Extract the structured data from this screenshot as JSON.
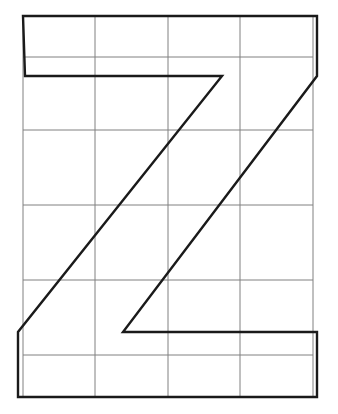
{
  "figure": {
    "glyph": "Z",
    "background_color": "#ffffff",
    "canvas": {
      "width": 338,
      "height": 414
    }
  },
  "grid": {
    "name": "construction-grid",
    "stroke_color": "#808080",
    "stroke_width": 1,
    "columns": 4,
    "rows": 6,
    "x_lines": [
      23,
      95,
      168,
      240,
      313
    ],
    "y_lines": [
      16,
      57,
      130,
      205,
      280,
      355,
      397
    ],
    "bounds": {
      "left": 23,
      "top": 16,
      "right": 313,
      "bottom": 397
    }
  },
  "glyph_outline": {
    "name": "letter-z-outline",
    "stroke_color": "#1a1a1a",
    "stroke_width": 2.4,
    "fill": "none",
    "points": [
      [
        23,
        16
      ],
      [
        317,
        16
      ],
      [
        317,
        76
      ],
      [
        123,
        332
      ],
      [
        317,
        332
      ],
      [
        317,
        397
      ],
      [
        18,
        397
      ],
      [
        18,
        332
      ],
      [
        222,
        76
      ],
      [
        25,
        76
      ]
    ],
    "vertices": [
      {
        "label": "top-left-outer",
        "x": 23,
        "y": 16
      },
      {
        "label": "top-right-outer",
        "x": 317,
        "y": 16
      },
      {
        "label": "top-right-inner",
        "x": 317,
        "y": 76
      },
      {
        "label": "diagonal-right-bottom",
        "x": 123,
        "y": 332
      },
      {
        "label": "bottom-right-inner",
        "x": 317,
        "y": 332
      },
      {
        "label": "bottom-right-outer",
        "x": 317,
        "y": 397
      },
      {
        "label": "bottom-left-outer",
        "x": 18,
        "y": 397
      },
      {
        "label": "bottom-left-inner",
        "x": 18,
        "y": 332
      },
      {
        "label": "diagonal-left-top",
        "x": 222,
        "y": 76
      },
      {
        "label": "top-left-inner",
        "x": 25,
        "y": 76
      }
    ]
  }
}
